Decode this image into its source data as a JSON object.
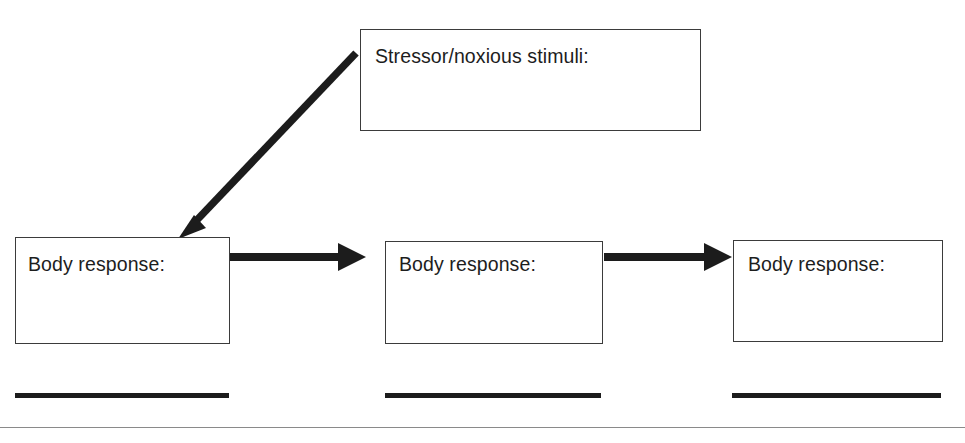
{
  "diagram": {
    "nodes": [
      {
        "id": "stressor",
        "label": "Stressor/noxious stimuli:",
        "role": "trigger"
      },
      {
        "id": "body-response-1",
        "label": "Body response:",
        "role": "response"
      },
      {
        "id": "body-response-2",
        "label": "Body response:",
        "role": "response"
      },
      {
        "id": "body-response-3",
        "label": "Body response:",
        "role": "response"
      }
    ],
    "edges": [
      {
        "id": "edge-stressor-to-response-1",
        "from": "stressor",
        "to": "body-response-1",
        "style": "diagonal-thick-arrow"
      },
      {
        "id": "edge-response-1-to-response-2",
        "from": "body-response-1",
        "to": "body-response-2",
        "style": "horizontal-thick-arrow"
      },
      {
        "id": "edge-response-2-to-response-3",
        "from": "body-response-2",
        "to": "body-response-3",
        "style": "horizontal-thick-arrow"
      }
    ],
    "answer_lines": [
      {
        "id": "answer-line-1",
        "label": ""
      },
      {
        "id": "answer-line-2",
        "label": ""
      },
      {
        "id": "answer-line-3",
        "label": ""
      }
    ],
    "colors": {
      "box_border": "#3b3b3b",
      "text": "#1d1d1d",
      "arrow": "#1c1c1c",
      "rule_thick": "#1c1c1c",
      "page_rule": "#8a8a8a",
      "background": "#ffffff"
    }
  }
}
